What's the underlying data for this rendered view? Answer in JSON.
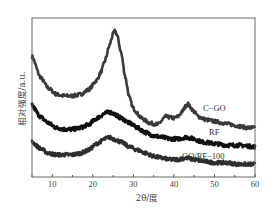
{
  "chart_data": {
    "type": "line",
    "title": "",
    "xlabel": "2θ/度",
    "ylabel": "相对强度/a.u.",
    "xlim": [
      5,
      60
    ],
    "ylim": [
      0,
      100
    ],
    "xticks": [
      10,
      20,
      30,
      40,
      50,
      60
    ],
    "xtick_labels": [
      "10",
      "20",
      "30",
      "40",
      "50",
      "60"
    ],
    "yticks": [],
    "grid": false,
    "legend": "inline labels at right",
    "series": [
      {
        "name": "C-GO",
        "label": "C−GO",
        "color": "#3a3a3a",
        "x": [
          5,
          7,
          9,
          11,
          13,
          15,
          17,
          19,
          21,
          22,
          23,
          24,
          25,
          25.5,
          26,
          27,
          28,
          29,
          30,
          32,
          34,
          36,
          38,
          40,
          41,
          42,
          43,
          43.5,
          44,
          45,
          46,
          48,
          50,
          52,
          54,
          56,
          58,
          60
        ],
        "y": [
          76,
          63,
          56,
          52,
          51,
          51,
          52,
          55,
          61,
          66,
          73,
          82,
          90,
          92,
          89,
          78,
          63,
          50,
          43,
          37,
          34,
          33,
          38,
          37,
          38,
          41,
          45,
          46,
          44,
          41,
          38,
          36,
          35,
          34,
          33,
          32,
          31,
          31
        ]
      },
      {
        "name": "RF",
        "label": "RF",
        "color": "#111111",
        "x": [
          5,
          7,
          9,
          11,
          13,
          15,
          17,
          19,
          21,
          23,
          24,
          25,
          27,
          29,
          31,
          33,
          35,
          37,
          39,
          41,
          43,
          45,
          47,
          50,
          53,
          56,
          60
        ],
        "y": [
          45,
          38,
          34,
          31,
          30,
          30,
          31,
          33,
          37,
          40,
          41,
          40,
          37,
          34,
          31,
          28,
          26,
          25,
          24,
          24,
          25,
          24,
          22,
          21,
          20,
          20,
          19
        ]
      },
      {
        "name": "GO/RF-100",
        "label": "GO/RF−100",
        "color": "#2e2e2e",
        "x": [
          5,
          7,
          9,
          11,
          13,
          15,
          17,
          19,
          21,
          23,
          24,
          25,
          27,
          29,
          31,
          33,
          35,
          37,
          39,
          41,
          43,
          45,
          47,
          50,
          53,
          56,
          60
        ],
        "y": [
          22,
          18,
          15,
          14,
          14,
          14,
          15,
          17,
          21,
          24,
          25,
          24,
          22,
          19,
          17,
          15,
          13,
          12,
          11,
          11,
          12,
          11,
          10,
          9,
          9,
          8,
          8
        ]
      }
    ]
  },
  "plot": {
    "left": 32,
    "top": 18,
    "right": 255,
    "bottom": 177
  }
}
